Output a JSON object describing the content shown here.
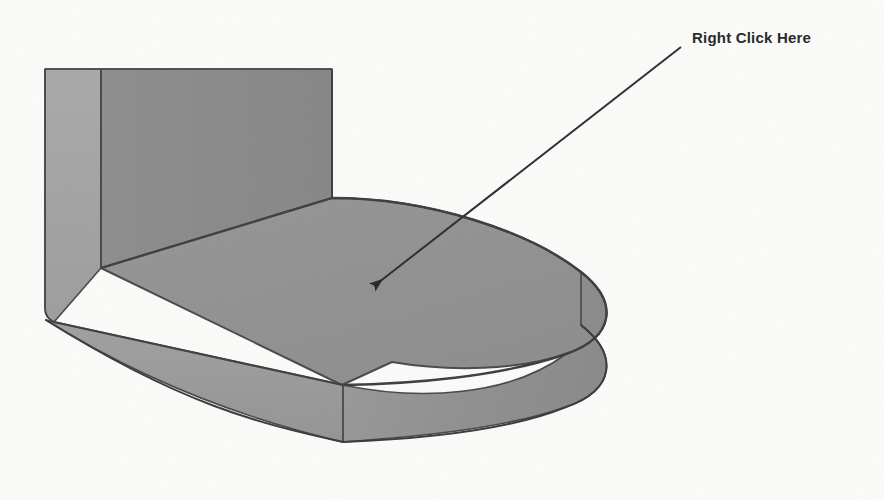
{
  "canvas": {
    "width": 884,
    "height": 500,
    "background_color": "#fbfbfa"
  },
  "annotation": {
    "label": "Right Click Here",
    "text_color": "#2b2b2b",
    "font_weight": "bold",
    "font_size_px": 15,
    "leader_line": {
      "color": "#2e2e2e",
      "width_px": 2,
      "start_x": 681,
      "start_y": 47,
      "end_x": 369,
      "end_y": 290,
      "arrowhead": "solid-triangle",
      "arrowhead_target": "top-face"
    }
  },
  "model": {
    "name": "l-bracket-with-rounded-end",
    "view": "isometric",
    "shading": {
      "top_face_color": "#919191",
      "back_wall_color": "#8a8a8a",
      "left_face_color": "#a3a3a3",
      "front_face_color": "#9b9b9b",
      "curved_end_face_color": "#939393",
      "edge_color": "#4a4a4a",
      "silhouette_edge_color": "#3c3c3c"
    },
    "faces": [
      {
        "id": "left-side-face",
        "label": "Left Side Face",
        "color": "#a3a3a3"
      },
      {
        "id": "back-wall-face",
        "label": "Vertical Back Wall",
        "color": "#8a8a8a"
      },
      {
        "id": "top-face",
        "label": "Top Face (right-click target)",
        "color": "#919191"
      },
      {
        "id": "front-face",
        "label": "Front Edge Face",
        "color": "#9b9b9b"
      },
      {
        "id": "curved-end-face",
        "label": "Rounded End Face",
        "color": "#939393"
      }
    ]
  }
}
